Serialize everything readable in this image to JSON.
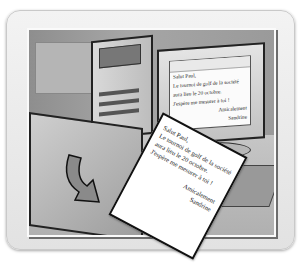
{
  "illustration": {
    "subject": "computer printing a letter",
    "monitor_letter": {
      "lines": [
        "Salut Paul,",
        "Le tournoi de golf de la société",
        "aura lieu le 20 octobre.",
        "J'espère me mesurer à toi !"
      ],
      "closing": "Amicalement",
      "signature": "Sandrine"
    },
    "printed_letter": {
      "lines": [
        "Salut Paul,",
        "Le tournoi de golf de la société",
        "aura lieu le 20 octobre.",
        "J'espère me mesurer à toi !"
      ],
      "closing": "Amicalement",
      "signature": "Sandrine"
    }
  }
}
